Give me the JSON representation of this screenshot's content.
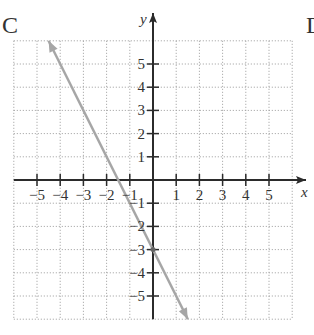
{
  "panel_label": "C",
  "next_panel_label_partial": "D",
  "chart_data": {
    "type": "line",
    "title": "",
    "xlabel": "x",
    "ylabel": "y",
    "xlim": [
      -6,
      6
    ],
    "ylim": [
      -6,
      6
    ],
    "grid": true,
    "grid_style": "dotted",
    "x_ticks": [
      -5,
      -4,
      -3,
      -2,
      -1,
      1,
      2,
      3,
      4,
      5
    ],
    "y_ticks": [
      -5,
      -4,
      -3,
      -2,
      -1,
      1,
      2,
      3,
      4,
      5
    ],
    "x_tick_labels": [
      "−5",
      "−4",
      "−3",
      "−2",
      "−1",
      "1",
      "2",
      "3",
      "4",
      "5"
    ],
    "y_tick_labels": [
      "−5",
      "−4",
      "−3",
      "−2",
      "−1",
      "1",
      "2",
      "3",
      "4",
      "5"
    ],
    "series": [
      {
        "name": "y = -2x - 3",
        "equation": "y = -2x - 3",
        "slope": -2,
        "y_intercept": -3,
        "x_intercept": -1.5,
        "points": [
          [
            -4.5,
            6
          ],
          [
            0,
            -3
          ],
          [
            1.5,
            -6
          ]
        ],
        "arrows_both_ends": true,
        "color": "#a6a6a6"
      }
    ],
    "marked_points": [
      [
        0,
        -3
      ]
    ]
  },
  "colors": {
    "axis": "#2b2b2b",
    "grid": "#9a9a9a",
    "line": "#a6a6a6",
    "text": "#333333"
  }
}
